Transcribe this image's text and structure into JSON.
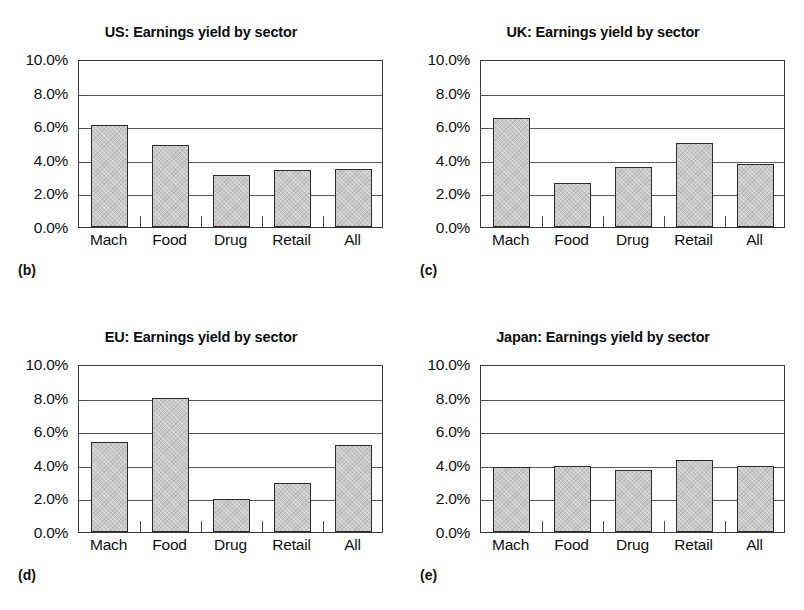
{
  "figure": {
    "width": 804,
    "height": 610,
    "background": "#ffffff",
    "bar_fill": "#c9c9c9",
    "bar_edge": "#2b2b2b",
    "grid_color": "#5a5a5a"
  },
  "axis": {
    "ytick_labels": [
      "10.0%",
      "8.0%",
      "6.0%",
      "4.0%",
      "2.0%",
      "0.0%"
    ],
    "ytick_values": [
      10.0,
      8.0,
      6.0,
      4.0,
      2.0,
      0.0
    ],
    "categories": [
      "Mach",
      "Food",
      "Drug",
      "Retail",
      "All"
    ],
    "ylim": [
      0,
      10
    ]
  },
  "panels": [
    {
      "key": "us",
      "caption": "(b)",
      "title": "US: Earnings yield by sector"
    },
    {
      "key": "uk",
      "caption": "(c)",
      "title": "UK: Earnings yield by sector"
    },
    {
      "key": "eu",
      "caption": "(d)",
      "title": "EU: Earnings yield by sector"
    },
    {
      "key": "japan",
      "caption": "(e)",
      "title": "Japan: Earnings yield by sector"
    }
  ],
  "chart_data": [
    {
      "type": "bar",
      "title": "US: Earnings yield by sector",
      "panel_label": "(b)",
      "categories": [
        "Mach",
        "Food",
        "Drug",
        "Retail",
        "All"
      ],
      "values": [
        6.05,
        4.9,
        3.1,
        3.4,
        3.45
      ],
      "xlabel": "",
      "ylabel": "",
      "ylim": [
        0,
        10
      ],
      "ytick_labels": [
        "0.0%",
        "2.0%",
        "4.0%",
        "6.0%",
        "8.0%",
        "10.0%"
      ],
      "grid": true,
      "legend": "none",
      "units": "percent"
    },
    {
      "type": "bar",
      "title": "UK: Earnings yield by sector",
      "panel_label": "(c)",
      "categories": [
        "Mach",
        "Food",
        "Drug",
        "Retail",
        "All"
      ],
      "values": [
        6.5,
        2.6,
        3.55,
        5.0,
        3.75
      ],
      "xlabel": "",
      "ylabel": "",
      "ylim": [
        0,
        10
      ],
      "ytick_labels": [
        "0.0%",
        "2.0%",
        "4.0%",
        "6.0%",
        "8.0%",
        "10.0%"
      ],
      "grid": true,
      "legend": "none",
      "units": "percent"
    },
    {
      "type": "bar",
      "title": "EU: Earnings yield by sector",
      "panel_label": "(d)",
      "categories": [
        "Mach",
        "Food",
        "Drug",
        "Retail",
        "All"
      ],
      "values": [
        5.35,
        8.0,
        1.95,
        2.9,
        5.15
      ],
      "xlabel": "",
      "ylabel": "",
      "ylim": [
        0,
        10
      ],
      "ytick_labels": [
        "0.0%",
        "2.0%",
        "4.0%",
        "6.0%",
        "8.0%",
        "10.0%"
      ],
      "grid": true,
      "legend": "none",
      "units": "percent"
    },
    {
      "type": "bar",
      "title": "Japan: Earnings yield by sector",
      "panel_label": "(e)",
      "categories": [
        "Mach",
        "Food",
        "Drug",
        "Retail",
        "All"
      ],
      "values": [
        3.85,
        3.9,
        3.7,
        4.3,
        3.9
      ],
      "xlabel": "",
      "ylabel": "",
      "ylim": [
        0,
        10
      ],
      "ytick_labels": [
        "0.0%",
        "2.0%",
        "4.0%",
        "6.0%",
        "8.0%",
        "10.0%"
      ],
      "grid": true,
      "legend": "none",
      "units": "percent"
    }
  ]
}
